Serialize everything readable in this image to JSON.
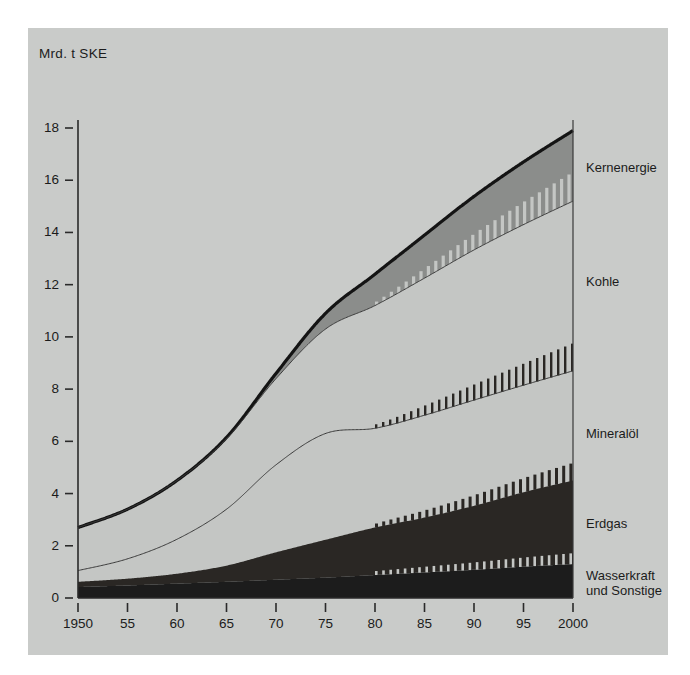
{
  "figure": {
    "background_color": "#ffffff",
    "panel_color": "#c9cbc9",
    "unit_label": "Mrd. t SKE"
  },
  "chart_data": {
    "type": "area",
    "title": "",
    "subtitle": "",
    "xlabel": "",
    "ylabel": "Mrd. t SKE",
    "xlim": [
      1950,
      2000
    ],
    "ylim": [
      0,
      18
    ],
    "grid": false,
    "legend_position": "right-inline",
    "stacked": true,
    "x_tick_labels": [
      "1950",
      "55",
      "60",
      "65",
      "70",
      "75",
      "80",
      "85",
      "90",
      "95",
      "2000"
    ],
    "x_tick_values": [
      1950,
      1955,
      1960,
      1965,
      1970,
      1975,
      1980,
      1985,
      1990,
      1995,
      2000
    ],
    "y_tick_labels": [
      "0",
      "2",
      "4",
      "6",
      "8",
      "10",
      "12",
      "14",
      "16",
      "18"
    ],
    "y_tick_values": [
      0,
      2,
      4,
      6,
      8,
      10,
      12,
      14,
      16,
      18
    ],
    "x": [
      1950,
      1955,
      1960,
      1965,
      1970,
      1975,
      1980,
      1985,
      1990,
      1995,
      2000
    ],
    "forecast_starts_at": 1980,
    "series": [
      {
        "name": "Wasserkraft und Sonstige",
        "label": "Wasserkraft\nund Sonstige",
        "label_line1": "Wasserkraft",
        "label_line2": "und Sonstige",
        "color": "#1c1c1c",
        "stack_order": 1,
        "values": [
          0.42,
          0.48,
          0.55,
          0.62,
          0.7,
          0.78,
          0.88,
          0.98,
          1.08,
          1.2,
          1.3
        ]
      },
      {
        "name": "Erdgas",
        "label": "Erdgas",
        "color": "#2a2724",
        "stack_order": 2,
        "values": [
          0.2,
          0.26,
          0.38,
          0.62,
          1.05,
          1.45,
          1.82,
          2.1,
          2.45,
          2.85,
          3.2
        ]
      },
      {
        "name": "Mineralöl",
        "label": "Mineralöl",
        "color": "#c4c6c4",
        "stack_order": 3,
        "values": [
          0.43,
          0.76,
          1.32,
          2.16,
          3.35,
          4.07,
          3.8,
          3.92,
          4.05,
          4.1,
          4.2
        ]
      },
      {
        "name": "Kohle",
        "label": "Kohle",
        "color": "#c4c6c4",
        "stack_order": 4,
        "values": [
          1.65,
          1.9,
          2.25,
          2.7,
          3.3,
          4.0,
          4.7,
          5.25,
          5.75,
          6.15,
          6.5
        ]
      },
      {
        "name": "Kernenergie",
        "label": "Kernenergie",
        "color": "#8b8d8b",
        "stack_order": 5,
        "values": [
          0.0,
          0.0,
          0.0,
          0.05,
          0.2,
          0.6,
          1.2,
          1.65,
          2.05,
          2.4,
          2.7
        ]
      }
    ],
    "stack_totals": [
      2.7,
      3.4,
      4.5,
      6.15,
      8.6,
      10.9,
      12.4,
      14.9,
      15.38,
      16.7,
      17.9
    ],
    "stack_boundaries": {
      "wasserkraft_top": [
        0.42,
        0.48,
        0.55,
        0.62,
        0.7,
        0.78,
        0.88,
        0.98,
        1.08,
        1.2,
        1.3
      ],
      "erdgas_top": [
        0.62,
        0.74,
        0.93,
        1.24,
        1.75,
        2.23,
        2.7,
        3.08,
        3.53,
        4.05,
        4.5
      ],
      "mineraloel_top": [
        1.05,
        1.5,
        2.25,
        3.4,
        5.1,
        6.3,
        6.5,
        7.0,
        7.58,
        8.15,
        8.7
      ],
      "kohle_top": [
        2.7,
        3.4,
        4.5,
        6.1,
        8.4,
        10.3,
        11.2,
        12.25,
        13.33,
        14.3,
        15.2
      ],
      "kernenergie_top": [
        2.7,
        3.4,
        4.5,
        6.15,
        8.6,
        10.9,
        12.4,
        13.9,
        15.38,
        16.7,
        17.9
      ]
    }
  },
  "axes": {
    "unit_label": "Mrd. t SKE",
    "y_ticks": [
      {
        "label": "18",
        "value": 18
      },
      {
        "label": "16",
        "value": 16
      },
      {
        "label": "14",
        "value": 14
      },
      {
        "label": "12",
        "value": 12
      },
      {
        "label": "10",
        "value": 10
      },
      {
        "label": "8",
        "value": 8
      },
      {
        "label": "6",
        "value": 6
      },
      {
        "label": "4",
        "value": 4
      },
      {
        "label": "2",
        "value": 2
      },
      {
        "label": "0",
        "value": 0
      }
    ],
    "x_ticks": [
      {
        "label": "1950",
        "value": 1950
      },
      {
        "label": "55",
        "value": 1955
      },
      {
        "label": "60",
        "value": 1960
      },
      {
        "label": "65",
        "value": 1965
      },
      {
        "label": "70",
        "value": 1970
      },
      {
        "label": "75",
        "value": 1975
      },
      {
        "label": "80",
        "value": 1980
      },
      {
        "label": "85",
        "value": 1985
      },
      {
        "label": "90",
        "value": 1990
      },
      {
        "label": "95",
        "value": 1995
      },
      {
        "label": "2000",
        "value": 2000
      }
    ]
  },
  "series_labels": [
    {
      "name": "Kernenergie",
      "text": "Kernenergie"
    },
    {
      "name": "Kohle",
      "text": "Kohle"
    },
    {
      "name": "Mineraloel",
      "text": "Mineralöl"
    },
    {
      "name": "Erdgas",
      "text": "Erdgas"
    },
    {
      "name": "Wasserkraft",
      "text_line1": "Wasserkraft",
      "text_line2": "und Sonstige"
    }
  ]
}
